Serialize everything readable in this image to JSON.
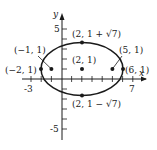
{
  "figure": {
    "type": "ellipse-graph",
    "equation_center": [
      2,
      1
    ],
    "semi_axis_horizontal": 4,
    "semi_axis_vertical": "√7",
    "axes": {
      "x_label": "x",
      "y_label": "y",
      "x_ticks_labeled": [
        "-3",
        "7"
      ],
      "y_ticks_labeled": [
        "5",
        "-5"
      ]
    },
    "points": [
      {
        "id": "top-vertex",
        "label": "(2, 1 + √7)",
        "x": 2,
        "y": 3.6458
      },
      {
        "id": "bottom-vertex",
        "label": "(2, 1 − √7)",
        "x": 2,
        "y": -1.6458
      },
      {
        "id": "left-vertex",
        "label": "(−2, 1)",
        "x": -2,
        "y": 1
      },
      {
        "id": "right-vertex",
        "label": "(6, 1)",
        "x": 6,
        "y": 1
      },
      {
        "id": "left-focus",
        "label": "(−1, 1)",
        "x": -1,
        "y": 1
      },
      {
        "id": "right-focus",
        "label": "(5, 1)",
        "x": 5,
        "y": 1
      },
      {
        "id": "center",
        "label": "(2, 1)",
        "x": 2,
        "y": 1
      }
    ],
    "color": "#1a1a1a"
  }
}
